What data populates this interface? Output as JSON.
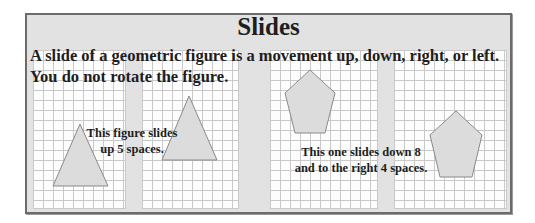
{
  "title": "Slides",
  "intro": {
    "line1": "A slide of a geometric figure is a movement up, down, right, or left.",
    "line2": "You do not rotate the figure."
  },
  "captions": {
    "triangle": {
      "line1": "This figure slides",
      "line2": "up 5 spaces."
    },
    "pentagon": {
      "line1": "This one slides down 8",
      "line2": "and to the right 4 spaces."
    }
  },
  "figures": [
    {
      "name": "triangle-original",
      "shape": "triangle"
    },
    {
      "name": "triangle-slid-up",
      "shape": "triangle"
    },
    {
      "name": "pentagon-original",
      "shape": "pentagon"
    },
    {
      "name": "pentagon-slid-down-right",
      "shape": "pentagon"
    }
  ],
  "colors": {
    "frame_bg": "#e2e2e2",
    "frame_border": "#6b6b6b",
    "grid_line": "#c9c9c9",
    "shape_fill": "#dcdcdc",
    "shape_stroke": "#8a8a8a",
    "text": "#1e1e1e"
  }
}
